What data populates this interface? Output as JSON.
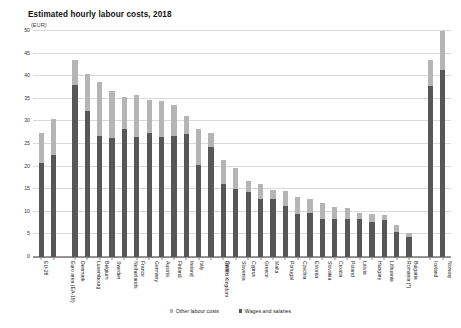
{
  "chart_data": {
    "type": "bar",
    "title": "Estimated hourly labour costs, 2018",
    "subtitle": "(EUR)",
    "xlabel": "",
    "ylabel": "",
    "ylim": [
      0,
      50
    ],
    "yticks": [
      0,
      5,
      10,
      15,
      20,
      25,
      30,
      35,
      40,
      45,
      50
    ],
    "grid": true,
    "stacked": true,
    "legend_position": "bottom",
    "categories": [
      "EU-28",
      "Euro area (EA-19)",
      "Denmark",
      "Luxembourg",
      "Belgium",
      "Sweden",
      "Netherlands",
      "France",
      "Germany",
      "Austria",
      "Finland",
      "Ireland",
      "Italy",
      "United Kingdom",
      "Spain",
      "Slovenia",
      "Cyprus",
      "Greece",
      "Malta",
      "Portugal",
      "Czechia",
      "Estonia",
      "Slovakia",
      "Croatia",
      "Poland",
      "Latvia",
      "Hungary",
      "Lithuania",
      "Romania (*)",
      "Bulgaria",
      "Iceland",
      "Norway"
    ],
    "series": [
      {
        "name": "Wages and salaries",
        "color": "#575757",
        "values": [
          20.8,
          22.5,
          38.0,
          32.4,
          26.8,
          26.3,
          28.4,
          26.6,
          27.5,
          26.6,
          26.7,
          27.3,
          20.3,
          24.3,
          16.1,
          15.1,
          14.4,
          12.9,
          12.9,
          11.2,
          9.6,
          9.8,
          8.3,
          8.4,
          8.3,
          8.4,
          7.7,
          8.1,
          5.5,
          4.5,
          37.8,
          41.3
        ]
      },
      {
        "name": "Other labour costs",
        "color": "#b5b5b5",
        "values": [
          6.6,
          8.1,
          5.5,
          8.2,
          12.0,
          10.4,
          7.0,
          9.2,
          7.3,
          7.9,
          7.0,
          3.8,
          8.0,
          3.1,
          5.3,
          4.5,
          2.5,
          3.3,
          2.0,
          3.4,
          3.6,
          3.0,
          3.6,
          2.7,
          2.6,
          1.4,
          1.9,
          1.1,
          1.5,
          0.9,
          5.7,
          8.7
        ]
      }
    ],
    "totals": [
      27.4,
      30.6,
      43.5,
      40.6,
      38.8,
      36.7,
      35.4,
      35.8,
      34.8,
      34.5,
      33.7,
      31.1,
      28.3,
      27.4,
      21.4,
      19.6,
      16.9,
      16.2,
      14.9,
      14.6,
      13.2,
      12.8,
      11.9,
      11.1,
      10.9,
      9.8,
      9.6,
      9.2,
      7.0,
      5.4,
      43.5,
      50.0
    ],
    "group_gaps_after": [
      1,
      29
    ],
    "legend": [
      {
        "label": "Other labour costs",
        "color": "#b5b5b5"
      },
      {
        "label": "Wages and salaries",
        "color": "#575757"
      }
    ]
  }
}
